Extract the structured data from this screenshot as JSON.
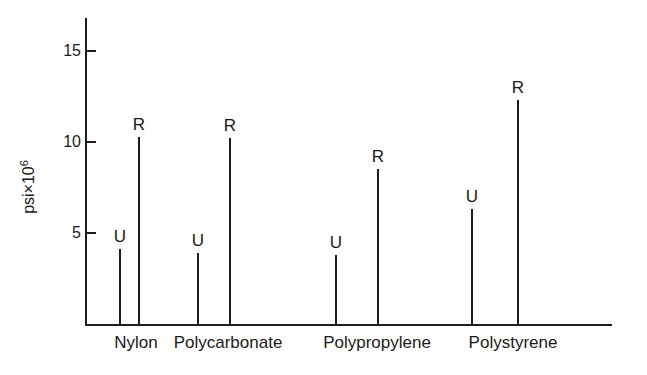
{
  "chart_data": {
    "type": "bar",
    "title": "",
    "subtitle": "",
    "xlabel": "",
    "ylabel": "psi×10^6",
    "ylabel_base": "psi×10",
    "ylabel_exp": "6",
    "ylim": [
      0,
      16.9
    ],
    "yticks": [
      5,
      10,
      15
    ],
    "ytick_labels": [
      "5",
      "10",
      "15"
    ],
    "grid": false,
    "legend": "none",
    "categories": [
      "Nylon",
      "Polycarbonate",
      "Polypropylene",
      "Polystyrene"
    ],
    "series": [
      {
        "name": "U",
        "label": "U",
        "values": [
          4.1,
          3.9,
          3.8,
          6.3
        ]
      },
      {
        "name": "R",
        "label": "R",
        "values": [
          10.3,
          10.2,
          8.5,
          12.3
        ]
      }
    ],
    "points": [
      {
        "category": "Nylon",
        "series": "U",
        "label": "U",
        "value": 4.1
      },
      {
        "category": "Nylon",
        "series": "R",
        "label": "R",
        "value": 10.3
      },
      {
        "category": "Polycarbonate",
        "series": "U",
        "label": "U",
        "value": 3.9
      },
      {
        "category": "Polycarbonate",
        "series": "R",
        "label": "R",
        "value": 10.2
      },
      {
        "category": "Polypropylene",
        "series": "U",
        "label": "U",
        "value": 3.8
      },
      {
        "category": "Polypropylene",
        "series": "R",
        "label": "R",
        "value": 8.5
      },
      {
        "category": "Polystyrene",
        "series": "U",
        "label": "U",
        "value": 6.3
      },
      {
        "category": "Polystyrene",
        "series": "R",
        "label": "R",
        "value": 12.3
      }
    ],
    "colors": {
      "axis": "#1d1d1d",
      "stem": "#1d1d1d",
      "text": "#1a1a1a",
      "background": "#ffffff"
    }
  },
  "layout": {
    "plot_left_px": 85,
    "plot_baseline_px": 324,
    "plot_top_px": 18,
    "plot_right_px": 612,
    "px_per_unit": 18.2,
    "stem_x": [
      119,
      138,
      197,
      229,
      335,
      377,
      471,
      517
    ],
    "category_label_x": [
      136,
      228,
      377,
      513
    ]
  }
}
